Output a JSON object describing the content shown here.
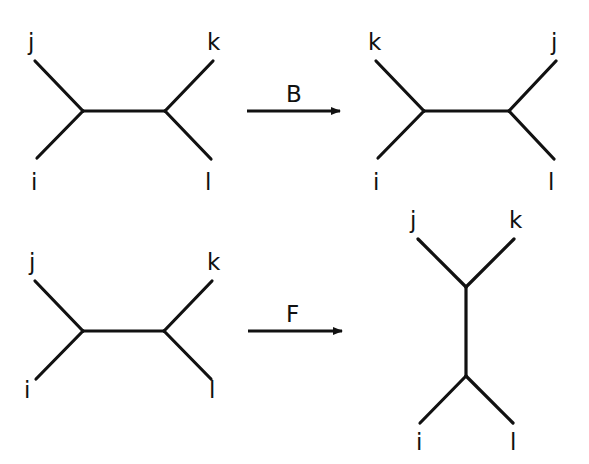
{
  "colors": {
    "line": "#111111",
    "background": "#ffffff"
  },
  "operations": [
    {
      "label": "B",
      "before": {
        "leaves": {
          "top_left": "j",
          "top_right": "k",
          "bottom_left": "i",
          "bottom_right": "l"
        },
        "orientation": "horizontal"
      },
      "after": {
        "leaves": {
          "top_left": "k",
          "top_right": "j",
          "bottom_left": "i",
          "bottom_right": "l"
        },
        "orientation": "horizontal"
      }
    },
    {
      "label": "F",
      "before": {
        "leaves": {
          "top_left": "j",
          "top_right": "k",
          "bottom_left": "i",
          "bottom_right": "l"
        },
        "orientation": "horizontal"
      },
      "after": {
        "leaves": {
          "top_left": "j",
          "top_right": "k",
          "bottom_left": "i",
          "bottom_right": "l"
        },
        "orientation": "vertical"
      }
    }
  ]
}
